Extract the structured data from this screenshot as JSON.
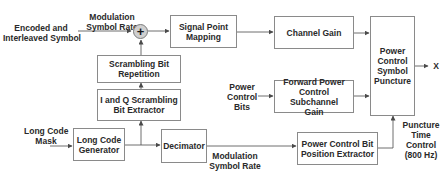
{
  "diagram": {
    "inputs": {
      "encoded_symbol": [
        "Encoded and",
        "Interleaved Symbol"
      ],
      "modulation_rate_top": [
        "Modulation",
        "Symbol Rate"
      ],
      "power_control_bits": [
        "Power",
        "Control",
        "Bits"
      ],
      "long_code_mask": [
        "Long Code",
        "Mask"
      ],
      "modulation_rate_bottom": [
        "Modulation",
        "Symbol Rate"
      ],
      "puncture_time_control": [
        "Puncture",
        "Time",
        "Control",
        "(800 Hz)"
      ]
    },
    "blocks": {
      "signal_point_mapping": [
        "Signal Point",
        "Mapping"
      ],
      "channel_gain": [
        "Channel Gain"
      ],
      "power_control_symbol_puncture": [
        "Power",
        "Control",
        "Symbol",
        "Puncture"
      ],
      "scrambling_bit_repetition": [
        "Scrambling Bit",
        "Repetition"
      ],
      "iq_scrambling_bit_extractor": [
        "I and Q Scrambling",
        "Bit Extractor"
      ],
      "forward_power_control_subchannel_gain": [
        "Forward Power",
        "Control Subchannel",
        "Gain"
      ],
      "long_code_generator": [
        "Long Code",
        "Generator"
      ],
      "decimator": [
        "Decimator"
      ],
      "power_control_bit_position_extractor": [
        "Power Control Bit",
        "Position Extractor"
      ]
    },
    "summer_symbol": "+",
    "output_label": "X",
    "colors": {
      "line": "#4a4a4a",
      "box_border": "#8a8a8a",
      "summer_fill": "#d0d0d0",
      "text": "#2a2a2a"
    }
  }
}
